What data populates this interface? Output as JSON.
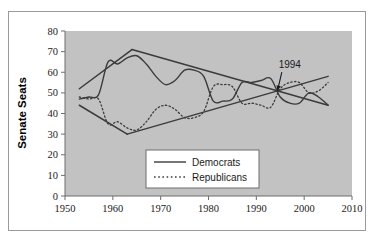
{
  "figure": {
    "background_color": "#ffffff",
    "frame_border_color": "#9a9a9a",
    "plot_background_color": "#c2c2c2",
    "series_color": "#3b3b3b"
  },
  "chart_data": {
    "type": "line",
    "title": "",
    "xlabel": "",
    "ylabel": "Senate Seats",
    "xlim": [
      1950,
      2010
    ],
    "ylim": [
      0,
      80
    ],
    "xticks": [
      1950,
      1960,
      1970,
      1980,
      1990,
      2000,
      2010
    ],
    "yticks": [
      0,
      10,
      20,
      30,
      40,
      50,
      60,
      70,
      80
    ],
    "xtick_labels": [
      "1950",
      "1960",
      "1970",
      "1980",
      "1990",
      "2000",
      "2010"
    ],
    "ytick_labels": [
      "0",
      "10",
      "20",
      "30",
      "40",
      "50",
      "60",
      "70",
      "80"
    ],
    "grid": false,
    "legend_position": "lower-center",
    "series": [
      {
        "name": "Democrats",
        "style": "solid",
        "color": "#3b3b3b",
        "x": [
          1953,
          1955,
          1957,
          1959,
          1961,
          1963,
          1965,
          1967,
          1969,
          1971,
          1973,
          1975,
          1977,
          1979,
          1981,
          1983,
          1985,
          1987,
          1989,
          1991,
          1993,
          1995,
          1997,
          1999,
          2001,
          2003,
          2005
        ],
        "values": [
          47,
          48,
          49,
          65,
          64,
          67,
          68,
          64,
          58,
          54,
          56,
          61,
          61,
          58,
          46,
          46,
          47,
          55,
          55,
          56,
          57,
          48,
          45,
          45,
          50,
          48,
          44
        ]
      },
      {
        "name": "Republicans",
        "style": "dotted",
        "color": "#3b3b3b",
        "x": [
          1953,
          1955,
          1957,
          1959,
          1961,
          1963,
          1965,
          1967,
          1969,
          1971,
          1973,
          1975,
          1977,
          1979,
          1981,
          1983,
          1985,
          1987,
          1989,
          1991,
          1993,
          1995,
          1997,
          1999,
          2001,
          2003,
          2005
        ],
        "values": [
          48,
          47,
          47,
          35,
          36,
          33,
          32,
          36,
          42,
          44,
          42,
          38,
          38,
          41,
          53,
          54,
          53,
          45,
          45,
          44,
          43,
          52,
          55,
          55,
          50,
          51,
          55
        ]
      }
    ],
    "trendlines": [
      {
        "name": "democrats-trend",
        "for_series": "Democrats",
        "style": "solid",
        "x": [
          1953,
          1964
        ],
        "values": [
          52,
          71
        ]
      },
      {
        "name": "democrats-trend-long",
        "for_series": "Democrats",
        "style": "solid",
        "x": [
          1964,
          2005
        ],
        "values": [
          71,
          44
        ]
      },
      {
        "name": "republicans-trend",
        "for_series": "Republicans",
        "style": "solid",
        "x": [
          1953,
          1963
        ],
        "values": [
          44,
          30
        ]
      },
      {
        "name": "republicans-trend-long",
        "for_series": "Republicans",
        "style": "solid",
        "x": [
          1963,
          2005
        ],
        "values": [
          30,
          58
        ]
      }
    ],
    "annotations": [
      {
        "name": "year-1994",
        "text": "1994",
        "x": 1994,
        "y": 50,
        "label_x": 1997,
        "label_y": 62,
        "arrow": true
      }
    ]
  },
  "legend": {
    "items": [
      {
        "label": "Democrats",
        "style": "solid"
      },
      {
        "label": "Republicans",
        "style": "dotted"
      }
    ]
  }
}
